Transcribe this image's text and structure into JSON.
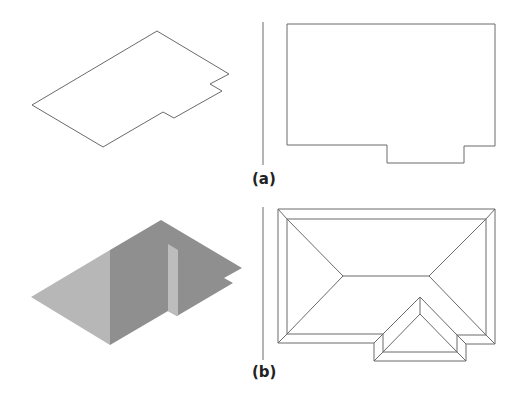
{
  "figure": {
    "panels": [
      {
        "id": "a",
        "label": "(a)",
        "left_view": "isometric-floor-outline",
        "right_view": "plan-outline"
      },
      {
        "id": "b",
        "label": "(b)",
        "left_view": "isometric-shaded-hip-roof",
        "right_view": "roof-plan-with-hips-and-dormer"
      }
    ],
    "colors": {
      "line": "#6a6a6a",
      "light_face": "#b7b7b7",
      "dark_face": "#8f8f8f",
      "dormer_wall": "#bdbdbd",
      "background": "#ffffff"
    }
  }
}
